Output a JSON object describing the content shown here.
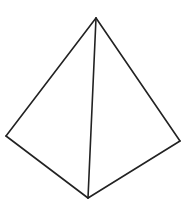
{
  "figure": {
    "shape": "tetrahedron",
    "stroke_color": "#222222",
    "background": "#ffffff",
    "vertices": {
      "top": [
        96,
        18
      ],
      "left": [
        6,
        136
      ],
      "right": [
        180,
        141
      ],
      "bottom": [
        88,
        198
      ]
    },
    "edges": [
      [
        "top",
        "left"
      ],
      [
        "top",
        "right"
      ],
      [
        "top",
        "bottom"
      ],
      [
        "left",
        "bottom"
      ],
      [
        "right",
        "bottom"
      ]
    ]
  }
}
